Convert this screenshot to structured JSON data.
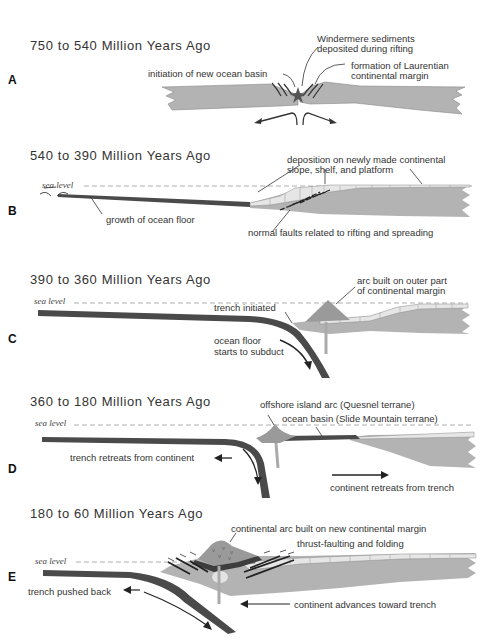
{
  "colors": {
    "continent": "#b3b3b3",
    "ocean_floor": "#4a4a4a",
    "shelf": "#e6e6e6",
    "arc": "#9a9a9a",
    "line": "#333333"
  },
  "sea_level_label": "sea level",
  "panels": [
    {
      "letter": "A",
      "title": "750 to 540 Million Years Ago",
      "labels": [
        "Windermere sediments",
        "deposited during rifting",
        "initiation of new ocean basin",
        "formation of Laurentian",
        "continental margin"
      ]
    },
    {
      "letter": "B",
      "title": "540 to 390 Million Years Ago",
      "labels": [
        "deposition on newly made continental",
        "slope, shelf, and platform",
        "growth of ocean floor",
        "normal faults related to rifting and spreading"
      ]
    },
    {
      "letter": "C",
      "title": "390 to 360 Million Years Ago",
      "labels": [
        "arc built on outer part",
        "of continental margin",
        "trench initiated",
        "ocean floor",
        "starts to subduct"
      ]
    },
    {
      "letter": "D",
      "title": "360 to 180 Million Years Ago",
      "labels": [
        "offshore island arc (Quesnel terrane)",
        "ocean basin (Slide Mountain terrane)",
        "trench retreats from continent",
        "continent retreats from trench"
      ]
    },
    {
      "letter": "E",
      "title": "180 to 60 Million Years Ago",
      "labels": [
        "continental arc built on new continental margin",
        "thrust-faulting and folding",
        "trench pushed back",
        "continent advances toward trench"
      ]
    }
  ]
}
